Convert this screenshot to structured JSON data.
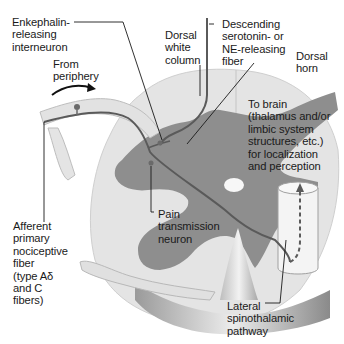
{
  "diagram": {
    "type": "anatomical-cross-section",
    "labels": {
      "enkephalin": "Enkephalin-\nreleasing\ninterneuron",
      "from_periphery": "From\nperiphery",
      "dorsal_white_column": "Dorsal\nwhite\ncolumn",
      "descending_fiber": "Descending\nserotonin- or\nNE-releasing\nfiber",
      "dorsal_horn": "Dorsal\nhorn",
      "to_brain": "To brain\n(thalamus and/or\nlimbic system\nstructures, etc.)\nfor localization\nand perception",
      "afferent": "Afferent\nprimary\nnociceptive\nfiber\n(type Aδ\nand C\nfibers)",
      "pain_transmission": "Pain\ntransmission\nneuron",
      "lateral_spinothalamic": "Lateral\nspinothalamic\npathway"
    },
    "colors": {
      "white_matter": "#e6e6e6",
      "gray_matter": "#8c8c8c",
      "neuron_line": "#5a5a5a",
      "leader_line": "#1a1a1a",
      "background": "#ffffff"
    }
  }
}
